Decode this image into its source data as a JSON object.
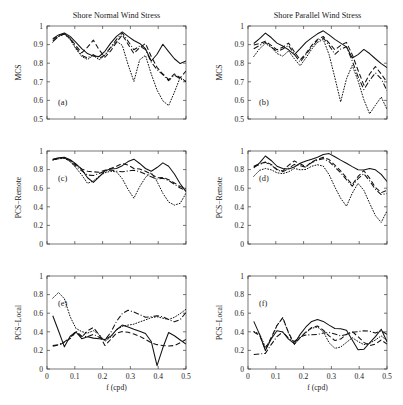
{
  "figure": {
    "titles": {
      "left": "Shore Normal Wind Stress",
      "right": "Shore Parallel Wind Stress"
    },
    "xlabel": "f (cpd)",
    "xticks": [
      "0",
      "0.1",
      "0.2",
      "0.3",
      "0.4",
      "0.5"
    ],
    "yticks_mcs": [
      "0.5",
      "0.6",
      "0.7",
      "0.8",
      "0.9",
      "1"
    ],
    "yticks_zero_one": [
      "0",
      "0.2",
      "0.4",
      "0.6",
      "0.8",
      "1"
    ],
    "ylabels": {
      "row1": "MCS",
      "row2": "PCS−Remote",
      "row3": "PCS−Local"
    },
    "panel_tags": [
      "(a)",
      "(b)",
      "(c)",
      "(d)",
      "(e)",
      "(f)"
    ],
    "line_color": "#111111"
  },
  "chart_data": [
    {
      "id": "a",
      "type": "line",
      "title": "Shore Normal Wind Stress",
      "tag": "(a)",
      "xlabel": "f (cpd)",
      "ylabel": "MCS",
      "xlim": [
        0,
        0.5
      ],
      "ylim": [
        0.5,
        1
      ],
      "xticks": [
        0,
        0.1,
        0.2,
        0.3,
        0.4,
        0.5
      ],
      "yticks": [
        0.5,
        0.6,
        0.7,
        0.8,
        0.9,
        1
      ],
      "grid": false,
      "legend": "none",
      "x": [
        0.0208,
        0.0417,
        0.0625,
        0.0833,
        0.1042,
        0.125,
        0.1458,
        0.1667,
        0.1875,
        0.2083,
        0.2292,
        0.25,
        0.2708,
        0.2917,
        0.3125,
        0.3333,
        0.3542,
        0.375,
        0.3958,
        0.4167,
        0.4375,
        0.4583,
        0.4792,
        0.5
      ],
      "series": [
        {
          "name": "solid",
          "style": "solid",
          "values": [
            0.932,
            0.952,
            0.962,
            0.944,
            0.912,
            0.878,
            0.852,
            0.838,
            0.836,
            0.864,
            0.908,
            0.944,
            0.968,
            0.944,
            0.922,
            0.906,
            0.878,
            0.812,
            0.848,
            0.902,
            0.862,
            0.824,
            0.798,
            0.812
          ]
        },
        {
          "name": "dashed",
          "style": "dashed",
          "values": [
            0.928,
            0.948,
            0.958,
            0.934,
            0.894,
            0.856,
            0.886,
            0.924,
            0.872,
            0.832,
            0.866,
            0.912,
            0.952,
            0.902,
            0.852,
            0.884,
            0.906,
            0.836,
            0.778,
            0.742,
            0.712,
            0.742,
            0.722,
            0.758
          ]
        },
        {
          "name": "dashdot",
          "style": "dashdot",
          "values": [
            0.918,
            0.944,
            0.958,
            0.932,
            0.884,
            0.842,
            0.828,
            0.846,
            0.824,
            0.846,
            0.886,
            0.928,
            0.962,
            0.918,
            0.872,
            0.892,
            0.874,
            0.806,
            0.766,
            0.738,
            0.706,
            0.736,
            0.716,
            0.702
          ]
        },
        {
          "name": "dotted",
          "style": "dotted",
          "values": [
            0.912,
            0.944,
            0.956,
            0.928,
            0.876,
            0.836,
            0.82,
            0.842,
            0.818,
            0.842,
            0.882,
            0.918,
            0.896,
            0.792,
            0.702,
            0.818,
            0.842,
            0.742,
            0.656,
            0.598,
            0.572,
            0.644,
            0.724,
            0.702
          ]
        }
      ]
    },
    {
      "id": "b",
      "type": "line",
      "title": "Shore Parallel Wind Stress",
      "tag": "(b)",
      "xlabel": "f (cpd)",
      "ylabel": "MCS",
      "xlim": [
        0,
        0.5
      ],
      "ylim": [
        0.5,
        1
      ],
      "xticks": [
        0,
        0.1,
        0.2,
        0.3,
        0.4,
        0.5
      ],
      "yticks": [
        0.5,
        0.6,
        0.7,
        0.8,
        0.9,
        1
      ],
      "grid": false,
      "legend": "none",
      "x": [
        0.0208,
        0.0417,
        0.0625,
        0.0833,
        0.1042,
        0.125,
        0.1458,
        0.1667,
        0.1875,
        0.2083,
        0.2292,
        0.25,
        0.2708,
        0.2917,
        0.3125,
        0.3333,
        0.3542,
        0.375,
        0.3958,
        0.4167,
        0.4375,
        0.4583,
        0.4792,
        0.5
      ],
      "series": [
        {
          "name": "solid",
          "style": "solid",
          "values": [
            0.906,
            0.932,
            0.962,
            0.938,
            0.908,
            0.892,
            0.872,
            0.846,
            0.878,
            0.912,
            0.936,
            0.958,
            0.974,
            0.952,
            0.928,
            0.908,
            0.888,
            0.828,
            0.846,
            0.874,
            0.852,
            0.824,
            0.798,
            0.776
          ]
        },
        {
          "name": "dashed",
          "style": "dashed",
          "values": [
            0.898,
            0.906,
            0.918,
            0.896,
            0.872,
            0.886,
            0.908,
            0.862,
            0.818,
            0.852,
            0.896,
            0.928,
            0.944,
            0.908,
            0.872,
            0.896,
            0.912,
            0.846,
            0.762,
            0.682,
            0.742,
            0.782,
            0.742,
            0.698
          ]
        },
        {
          "name": "dashdot",
          "style": "dashdot",
          "values": [
            0.878,
            0.896,
            0.912,
            0.888,
            0.862,
            0.876,
            0.896,
            0.848,
            0.806,
            0.846,
            0.888,
            0.922,
            0.936,
            0.896,
            0.848,
            0.876,
            0.888,
            0.812,
            0.728,
            0.658,
            0.708,
            0.748,
            0.716,
            0.652
          ]
        },
        {
          "name": "dotted",
          "style": "dotted",
          "values": [
            0.836,
            0.878,
            0.906,
            0.886,
            0.852,
            0.838,
            0.866,
            0.824,
            0.786,
            0.828,
            0.876,
            0.912,
            0.928,
            0.846,
            0.722,
            0.592,
            0.716,
            0.788,
            0.706,
            0.604,
            0.528,
            0.574,
            0.618,
            0.552
          ]
        }
      ]
    },
    {
      "id": "c",
      "type": "line",
      "title": "",
      "tag": "(c)",
      "xlabel": "f (cpd)",
      "ylabel": "PCS−Remote",
      "xlim": [
        0,
        0.5
      ],
      "ylim": [
        0,
        1
      ],
      "xticks": [
        0,
        0.1,
        0.2,
        0.3,
        0.4,
        0.5
      ],
      "yticks": [
        0,
        0.2,
        0.4,
        0.6,
        0.8,
        1
      ],
      "grid": false,
      "legend": "none",
      "x": [
        0.0208,
        0.0417,
        0.0625,
        0.0833,
        0.1042,
        0.125,
        0.1458,
        0.1667,
        0.1875,
        0.2083,
        0.2292,
        0.25,
        0.2708,
        0.2917,
        0.3125,
        0.3333,
        0.3542,
        0.375,
        0.3958,
        0.4167,
        0.4375,
        0.4583,
        0.4792,
        0.5
      ],
      "series": [
        {
          "name": "solid",
          "style": "solid",
          "values": [
            0.912,
            0.926,
            0.932,
            0.906,
            0.862,
            0.802,
            0.712,
            0.662,
            0.722,
            0.786,
            0.808,
            0.812,
            0.842,
            0.886,
            0.912,
            0.866,
            0.812,
            0.782,
            0.822,
            0.872,
            0.836,
            0.752,
            0.648,
            0.562
          ]
        },
        {
          "name": "dashed",
          "style": "dashed",
          "values": [
            0.908,
            0.922,
            0.928,
            0.898,
            0.852,
            0.808,
            0.782,
            0.776,
            0.772,
            0.792,
            0.812,
            0.836,
            0.866,
            0.848,
            0.812,
            0.806,
            0.782,
            0.752,
            0.712,
            0.716,
            0.692,
            0.656,
            0.618,
            0.596
          ]
        },
        {
          "name": "dashdot",
          "style": "dashdot",
          "values": [
            0.906,
            0.918,
            0.926,
            0.892,
            0.836,
            0.786,
            0.742,
            0.736,
            0.758,
            0.782,
            0.796,
            0.782,
            0.776,
            0.786,
            0.792,
            0.778,
            0.752,
            0.722,
            0.698,
            0.706,
            0.682,
            0.642,
            0.602,
            0.576
          ]
        },
        {
          "name": "dotted",
          "style": "dotted",
          "values": [
            0.902,
            0.916,
            0.922,
            0.886,
            0.818,
            0.742,
            0.652,
            0.678,
            0.728,
            0.766,
            0.782,
            0.776,
            0.702,
            0.586,
            0.492,
            0.616,
            0.716,
            0.768,
            0.672,
            0.546,
            0.452,
            0.418,
            0.438,
            0.546
          ]
        }
      ]
    },
    {
      "id": "d",
      "type": "line",
      "title": "",
      "tag": "(d)",
      "xlabel": "f (cpd)",
      "ylabel": "PCS−Remote",
      "xlim": [
        0,
        0.5
      ],
      "ylim": [
        0,
        1
      ],
      "xticks": [
        0,
        0.1,
        0.2,
        0.3,
        0.4,
        0.5
      ],
      "yticks": [
        0,
        0.2,
        0.4,
        0.6,
        0.8,
        1
      ],
      "grid": false,
      "legend": "none",
      "x": [
        0.0208,
        0.0417,
        0.0625,
        0.0833,
        0.1042,
        0.125,
        0.1458,
        0.1667,
        0.1875,
        0.2083,
        0.2292,
        0.25,
        0.2708,
        0.2917,
        0.3125,
        0.3333,
        0.3542,
        0.375,
        0.3958,
        0.4167,
        0.4375,
        0.4583,
        0.4792,
        0.5
      ],
      "series": [
        {
          "name": "solid",
          "style": "solid",
          "values": [
            0.818,
            0.872,
            0.946,
            0.898,
            0.836,
            0.812,
            0.806,
            0.828,
            0.868,
            0.892,
            0.912,
            0.932,
            0.962,
            0.972,
            0.938,
            0.902,
            0.868,
            0.832,
            0.798,
            0.796,
            0.812,
            0.798,
            0.748,
            0.672
          ]
        },
        {
          "name": "dashed",
          "style": "dashed",
          "values": [
            0.836,
            0.862,
            0.882,
            0.856,
            0.802,
            0.786,
            0.846,
            0.892,
            0.862,
            0.832,
            0.882,
            0.912,
            0.932,
            0.908,
            0.848,
            0.786,
            0.712,
            0.638,
            0.726,
            0.788,
            0.708,
            0.608,
            0.552,
            0.578
          ]
        },
        {
          "name": "dashdot",
          "style": "dashdot",
          "values": [
            0.828,
            0.856,
            0.878,
            0.848,
            0.796,
            0.776,
            0.812,
            0.856,
            0.842,
            0.826,
            0.876,
            0.902,
            0.918,
            0.886,
            0.826,
            0.766,
            0.692,
            0.622,
            0.702,
            0.756,
            0.678,
            0.588,
            0.532,
            0.542
          ]
        },
        {
          "name": "dotted",
          "style": "dotted",
          "values": [
            0.728,
            0.792,
            0.812,
            0.798,
            0.766,
            0.756,
            0.776,
            0.812,
            0.798,
            0.802,
            0.836,
            0.852,
            0.838,
            0.746,
            0.612,
            0.492,
            0.406,
            0.546,
            0.652,
            0.578,
            0.438,
            0.306,
            0.232,
            0.356
          ]
        }
      ]
    },
    {
      "id": "e",
      "type": "line",
      "title": "",
      "tag": "(e)",
      "xlabel": "f (cpd)",
      "ylabel": "PCS−Local",
      "xlim": [
        0,
        0.5
      ],
      "ylim": [
        0,
        1
      ],
      "xticks": [
        0,
        0.1,
        0.2,
        0.3,
        0.4,
        0.5
      ],
      "yticks": [
        0,
        0.2,
        0.4,
        0.6,
        0.8,
        1
      ],
      "grid": false,
      "legend": "none",
      "x": [
        0.0208,
        0.0417,
        0.0625,
        0.0833,
        0.1042,
        0.125,
        0.1458,
        0.1667,
        0.1875,
        0.2083,
        0.2292,
        0.25,
        0.2708,
        0.2917,
        0.3125,
        0.3333,
        0.3542,
        0.375,
        0.3958,
        0.4167,
        0.4375,
        0.4583,
        0.4792,
        0.5
      ],
      "series": [
        {
          "name": "solid",
          "style": "solid",
          "values": [
            0.572,
            0.408,
            0.238,
            0.352,
            0.398,
            0.326,
            0.346,
            0.332,
            0.326,
            0.318,
            0.352,
            0.422,
            0.472,
            0.452,
            0.428,
            0.406,
            0.382,
            0.296,
            0.036,
            0.228,
            0.392,
            0.358,
            0.312,
            0.268
          ]
        },
        {
          "name": "dashed",
          "style": "dashed",
          "values": [
            0.246,
            0.256,
            0.286,
            0.326,
            0.398,
            0.342,
            0.412,
            0.446,
            0.368,
            0.252,
            0.318,
            0.386,
            0.402,
            0.396,
            0.376,
            0.352,
            0.318,
            0.282,
            0.262,
            0.252,
            0.248,
            0.252,
            0.282,
            0.318
          ]
        },
        {
          "name": "dashdot",
          "style": "dashdot",
          "values": [
            0.252,
            0.262,
            0.292,
            0.336,
            0.406,
            0.352,
            0.348,
            0.372,
            0.342,
            0.312,
            0.392,
            0.512,
            0.596,
            0.632,
            0.612,
            0.586,
            0.556,
            0.562,
            0.572,
            0.562,
            0.532,
            0.508,
            0.532,
            0.608
          ]
        },
        {
          "name": "dotted",
          "style": "dotted",
          "values": [
            0.762,
            0.822,
            0.756,
            0.562,
            0.436,
            0.402,
            0.386,
            0.412,
            0.372,
            0.298,
            0.342,
            0.422,
            0.458,
            0.472,
            0.482,
            0.506,
            0.528,
            0.552,
            0.562,
            0.546,
            0.532,
            0.556,
            0.596,
            0.642
          ]
        }
      ]
    },
    {
      "id": "f",
      "type": "line",
      "title": "",
      "tag": "(f)",
      "xlabel": "f (cpd)",
      "ylabel": "PCS−Local",
      "xlim": [
        0,
        0.5
      ],
      "ylim": [
        0,
        1
      ],
      "xticks": [
        0,
        0.1,
        0.2,
        0.3,
        0.4,
        0.5
      ],
      "yticks": [
        0,
        0.2,
        0.4,
        0.6,
        0.8,
        1
      ],
      "grid": false,
      "legend": "none",
      "x": [
        0.0208,
        0.0417,
        0.0625,
        0.0833,
        0.1042,
        0.125,
        0.1458,
        0.1667,
        0.1875,
        0.2083,
        0.2292,
        0.25,
        0.2708,
        0.2917,
        0.3125,
        0.3333,
        0.3542,
        0.375,
        0.3958,
        0.4167,
        0.4375,
        0.4583,
        0.4792,
        0.5
      ],
      "series": [
        {
          "name": "solid",
          "style": "solid",
          "values": [
            0.512,
            0.372,
            0.198,
            0.322,
            0.412,
            0.398,
            0.322,
            0.272,
            0.372,
            0.452,
            0.512,
            0.532,
            0.512,
            0.472,
            0.436,
            0.432,
            0.416,
            0.312,
            0.206,
            0.212,
            0.282,
            0.348,
            0.428,
            0.292
          ]
        },
        {
          "name": "dashed",
          "style": "dashed",
          "values": [
            0.398,
            0.362,
            0.212,
            0.338,
            0.468,
            0.552,
            0.392,
            0.268,
            0.338,
            0.398,
            0.446,
            0.462,
            0.418,
            0.356,
            0.306,
            0.322,
            0.372,
            0.402,
            0.348,
            0.286,
            0.252,
            0.268,
            0.312,
            0.268
          ]
        },
        {
          "name": "dashdot",
          "style": "dashdot",
          "values": [
            0.156,
            0.162,
            0.168,
            0.262,
            0.348,
            0.398,
            0.332,
            0.296,
            0.346,
            0.366,
            0.368,
            0.372,
            0.386,
            0.392,
            0.376,
            0.356,
            0.372,
            0.396,
            0.402,
            0.412,
            0.406,
            0.386,
            0.412,
            0.372
          ]
        },
        {
          "name": "dotted",
          "style": "dotted",
          "values": [
            0.402,
            0.378,
            0.236,
            0.318,
            0.468,
            0.548,
            0.386,
            0.262,
            0.336,
            0.392,
            0.438,
            0.452,
            0.402,
            0.282,
            0.222,
            0.236,
            0.286,
            0.336,
            0.296,
            0.262,
            0.276,
            0.312,
            0.356,
            0.306
          ]
        }
      ]
    }
  ]
}
